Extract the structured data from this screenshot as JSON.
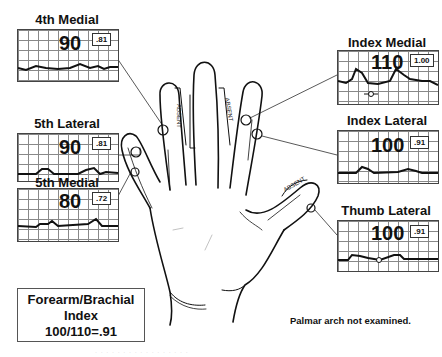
{
  "panels": {
    "fourth_medial": {
      "title": "4th Medial",
      "pressure": "90",
      "ratio": ".81"
    },
    "fifth_lateral": {
      "title": "5th Lateral",
      "pressure": "90",
      "ratio": ".81"
    },
    "fifth_medial": {
      "title": "5th Medial",
      "pressure": "80",
      "ratio": ".72"
    },
    "index_medial": {
      "title": "Index Medial",
      "pressure": "110",
      "ratio": "1.00"
    },
    "index_lateral": {
      "title": "Index Lateral",
      "pressure": "100",
      "ratio": ".91"
    },
    "thumb_lateral": {
      "title": "Thumb Lateral",
      "pressure": "100",
      "ratio": ".91"
    }
  },
  "hand": {
    "absent_labels": [
      "ABSENT",
      "ABSENT",
      "ABSENT"
    ]
  },
  "forearm_brachial": {
    "line1": "Forearm/Brachial",
    "line2": "Index",
    "line3": "100/110=.91"
  },
  "note": "Palmar arch not examined.",
  "footer_faint": "· · · · · · · ·   · · · · ·   · · · ·"
}
